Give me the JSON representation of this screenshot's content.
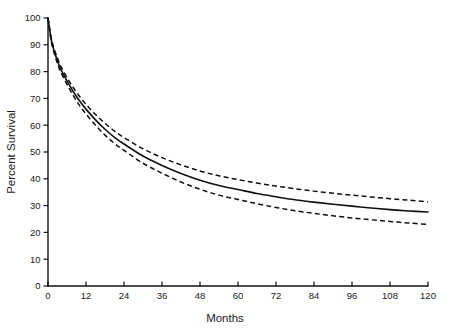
{
  "chart_data": {
    "type": "line",
    "title": "",
    "xlabel": "Months",
    "ylabel": "Percent Survival",
    "xlim": [
      0,
      120
    ],
    "ylim": [
      0,
      100
    ],
    "grid": false,
    "legend_position": "none",
    "x_ticks": [
      0,
      12,
      24,
      36,
      48,
      60,
      72,
      84,
      96,
      108,
      120
    ],
    "x_tick_labels": [
      "0",
      "12",
      "24",
      "36",
      "48",
      "60",
      "72",
      "84",
      "96",
      "108",
      "120"
    ],
    "y_ticks": [
      0,
      10,
      20,
      30,
      40,
      50,
      60,
      70,
      80,
      90,
      100
    ],
    "y_tick_labels": [
      "0",
      "10",
      "20",
      "30",
      "40",
      "50",
      "60",
      "70",
      "80",
      "90",
      "100"
    ],
    "x": [
      0,
      1,
      2,
      3,
      4,
      6,
      8,
      10,
      12,
      15,
      18,
      21,
      24,
      30,
      36,
      42,
      48,
      54,
      60,
      66,
      72,
      78,
      84,
      90,
      96,
      102,
      108,
      114,
      120
    ],
    "series": [
      {
        "name": "Survival estimate",
        "style": "solid",
        "values": [
          100.0,
          92.0,
          87.5,
          84.0,
          81.0,
          76.5,
          72.5,
          69.0,
          66.0,
          62.0,
          58.5,
          55.5,
          53.0,
          48.5,
          45.0,
          42.0,
          39.5,
          37.5,
          36.0,
          34.5,
          33.3,
          32.2,
          31.3,
          30.5,
          29.8,
          29.1,
          28.5,
          28.0,
          27.6
        ]
      },
      {
        "name": "Upper 95% confidence limit",
        "style": "dashed",
        "values": [
          100.0,
          92.6,
          88.3,
          85.0,
          82.1,
          77.8,
          74.0,
          70.7,
          67.8,
          64.0,
          60.7,
          57.8,
          55.4,
          51.2,
          47.9,
          45.2,
          42.9,
          41.1,
          39.7,
          38.4,
          37.3,
          36.3,
          35.4,
          34.6,
          33.9,
          33.2,
          32.6,
          32.0,
          31.4
        ]
      },
      {
        "name": "Lower 95% confidence limit",
        "style": "dashed",
        "values": [
          100.0,
          91.4,
          86.7,
          83.0,
          79.9,
          75.2,
          71.0,
          67.3,
          64.2,
          60.0,
          56.3,
          53.2,
          50.6,
          45.8,
          42.1,
          38.8,
          36.1,
          33.9,
          32.3,
          30.7,
          29.3,
          28.1,
          27.1,
          26.2,
          25.4,
          24.7,
          24.1,
          23.5,
          23.0
        ]
      }
    ],
    "annotations": []
  },
  "axes": {
    "x_axis_title": "Months",
    "y_axis_title": "Percent Survival"
  },
  "colors": {
    "background": "#ffffff",
    "ink": "#111111",
    "curve": "#111111"
  }
}
